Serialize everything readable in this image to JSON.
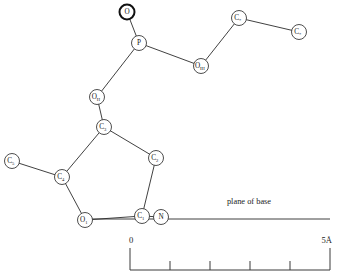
{
  "figure": {
    "background_color": "#ffffff",
    "bond_color": "#2b2b2b",
    "atom_outline_color": "#3a3a3a",
    "text_color": "#1b1b1b"
  },
  "atoms": [
    {
      "id": "O",
      "element": "O",
      "subscript": "",
      "x": 127,
      "y": 12,
      "r": 7.5,
      "emphasis": true
    },
    {
      "id": "P",
      "element": "P",
      "subscript": "",
      "x": 139,
      "y": 43,
      "r": 7.5,
      "emphasis": false
    },
    {
      "id": "O3",
      "element": "O",
      "subscript": "III",
      "x": 201,
      "y": 66,
      "r": 7.5,
      "emphasis": false
    },
    {
      "id": "C3star",
      "element": "C",
      "subscript": "*",
      "x": 239,
      "y": 18,
      "r": 7.5,
      "emphasis": false
    },
    {
      "id": "C4star",
      "element": "C",
      "subscript": "*",
      "x": 299,
      "y": 32,
      "r": 7.5,
      "emphasis": false
    },
    {
      "id": "O5",
      "element": "O",
      "subscript": "II",
      "x": 97,
      "y": 97,
      "r": 7.5,
      "emphasis": false
    },
    {
      "id": "C3p",
      "element": "C",
      "subscript": "3",
      "x": 104,
      "y": 127,
      "r": 7.5,
      "emphasis": false
    },
    {
      "id": "C2p",
      "element": "C",
      "subscript": "2",
      "x": 156,
      "y": 158,
      "r": 7.5,
      "emphasis": false
    },
    {
      "id": "C4p",
      "element": "C",
      "subscript": "4",
      "x": 62,
      "y": 177,
      "r": 7.5,
      "emphasis": false
    },
    {
      "id": "C5p",
      "element": "C",
      "subscript": "5",
      "x": 12,
      "y": 161,
      "r": 7.5,
      "emphasis": false
    },
    {
      "id": "O1p",
      "element": "O",
      "subscript": "1",
      "x": 85,
      "y": 220,
      "r": 7.5,
      "emphasis": false
    },
    {
      "id": "C1p",
      "element": "C",
      "subscript": "1",
      "x": 142,
      "y": 216,
      "r": 7.5,
      "emphasis": false
    },
    {
      "id": "N",
      "element": "N",
      "subscript": "",
      "x": 161,
      "y": 217,
      "r": 7.5,
      "emphasis": false
    }
  ],
  "bonds": [
    {
      "from": "O",
      "to": "P"
    },
    {
      "from": "P",
      "to": "O3"
    },
    {
      "from": "P",
      "to": "O5"
    },
    {
      "from": "O3",
      "to": "C3star"
    },
    {
      "from": "C3star",
      "to": "C4star"
    },
    {
      "from": "O5",
      "to": "C3p"
    },
    {
      "from": "C3p",
      "to": "C2p"
    },
    {
      "from": "C3p",
      "to": "C4p"
    },
    {
      "from": "C2p",
      "to": "C1p"
    },
    {
      "from": "C4p",
      "to": "C5p"
    },
    {
      "from": "C4p",
      "to": "O1p"
    },
    {
      "from": "O1p",
      "to": "C1p"
    },
    {
      "from": "C1p",
      "to": "N"
    }
  ],
  "plane_of_base": {
    "label": "plane of base",
    "label_x": 249,
    "label_y": 204,
    "line_x1": 92,
    "line_x2": 330,
    "line_y": 219
  },
  "scale_bar": {
    "left_label": "0",
    "right_label": "5Å",
    "x_start": 130,
    "x_end": 330,
    "baseline_y": 270,
    "end_cap_height": 22,
    "tick_height": 9,
    "tick_count": 4,
    "divisions": 5,
    "label_y": 243
  },
  "chart_data": {
    "type": "scatter",
    "xlabel": "",
    "ylabel": "",
    "scale_units": "Å",
    "scale_range": [
      0,
      5
    ],
    "annotations": [
      "plane of base",
      "0",
      "5Å"
    ],
    "node_labels": [
      "O",
      "P",
      "O_III",
      "C*",
      "C*",
      "O_II",
      "C3",
      "C2",
      "C4",
      "C5",
      "O1",
      "C1",
      "N"
    ]
  }
}
